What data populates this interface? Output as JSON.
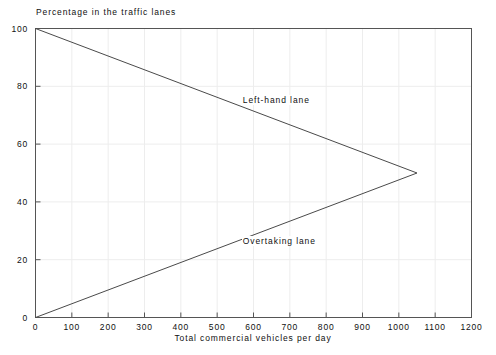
{
  "chart_data": {
    "type": "line",
    "title": "Percentage in the traffic lanes",
    "subtitle": "",
    "xlabel": "Total commercial vehicles per day",
    "ylabel": "Percentage in the traffic lanes",
    "xlim": [
      0,
      1200
    ],
    "ylim": [
      0,
      100
    ],
    "xticks": [
      0,
      100,
      200,
      300,
      400,
      500,
      600,
      700,
      800,
      900,
      1000,
      1100,
      1200
    ],
    "yticks": [
      0,
      20,
      40,
      60,
      80,
      100
    ],
    "xtick_labels": [
      "0",
      "100",
      "200",
      "300",
      "400",
      "500",
      "600",
      "700",
      "800",
      "900",
      "1000",
      "1100",
      "1200"
    ],
    "ytick_labels": [
      "0",
      "20",
      "40",
      "60",
      "80",
      "100"
    ],
    "grid": true,
    "legend_position": "inline-annotations",
    "series": [
      {
        "name": "Left-hand lane",
        "label": "Left-hand lane",
        "color": "#4a4a4a",
        "x": [
          0,
          1050
        ],
        "values": [
          100,
          50
        ],
        "annotation": {
          "text": "Left-hand lane",
          "x": 700,
          "y": 75
        }
      },
      {
        "name": "Overtaking lane",
        "label": "Overtaking lane",
        "color": "#4a4a4a",
        "x": [
          0,
          1050
        ],
        "values": [
          0,
          50
        ],
        "annotation": {
          "text": "Overtaking lane",
          "x": 700,
          "y": 26
        }
      }
    ],
    "annotations": [
      {
        "text": "Left-hand lane",
        "x": 700,
        "y": 75
      },
      {
        "text": "Overtaking lane",
        "x": 700,
        "y": 26
      }
    ],
    "colors": {
      "line": "#4a4a4a",
      "axis": "#555555",
      "grid": "#ededed",
      "text": "#101010",
      "background": "#ffffff"
    }
  },
  "axis": {
    "y_labels": [
      "100",
      "80",
      "60",
      "40",
      "20",
      "0"
    ],
    "x_labels": [
      "0",
      "100",
      "200",
      "300",
      "400",
      "500",
      "600",
      "700",
      "800",
      "900",
      "1000",
      "1100",
      "1200"
    ]
  }
}
